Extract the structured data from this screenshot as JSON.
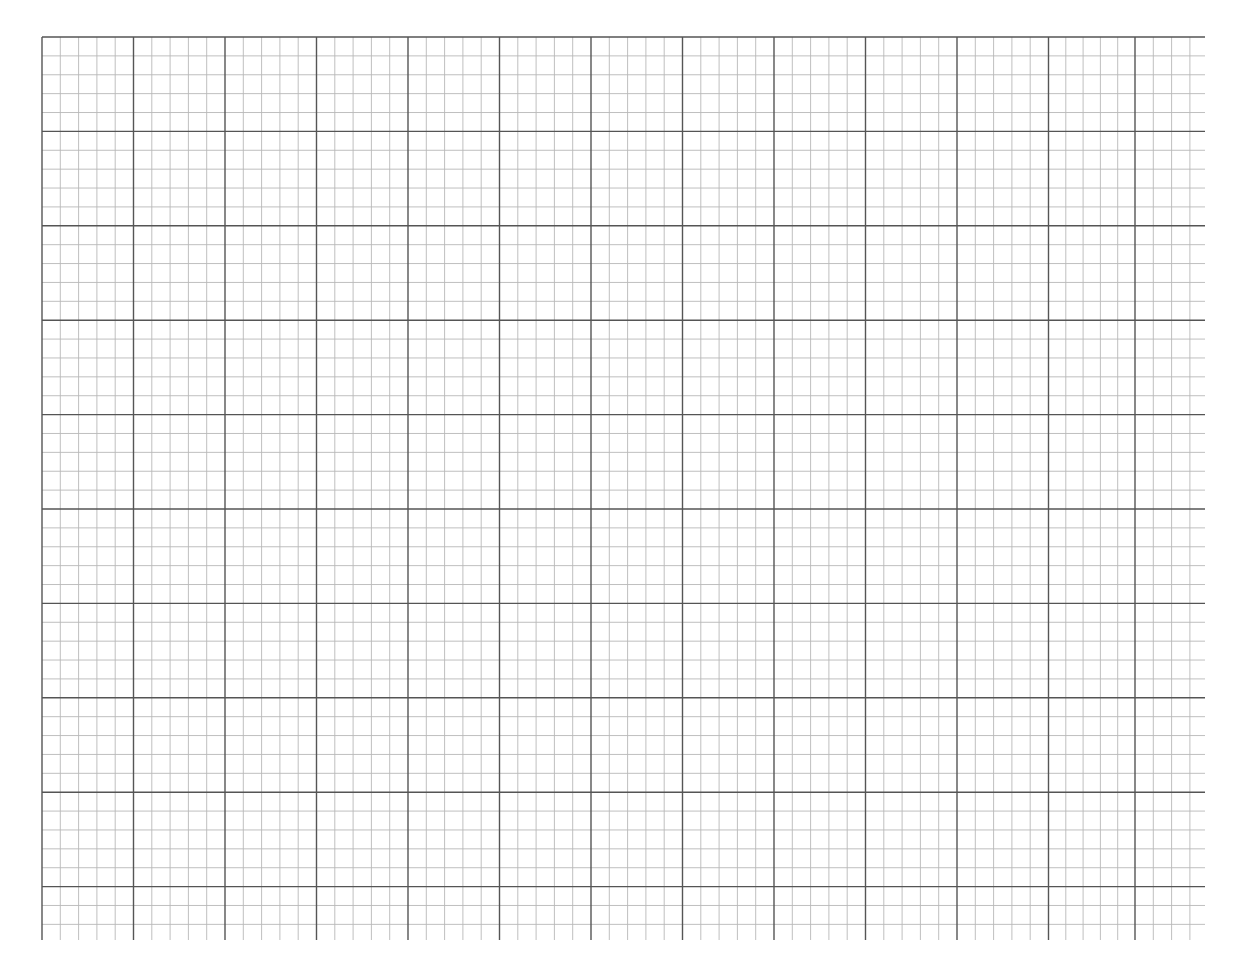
{
  "sheet": {
    "type": "graph-paper",
    "background_color": "#ffffff",
    "grid": {
      "origin_x": 42,
      "origin_y": 37,
      "right_edge_x": 1205,
      "bottom_edge_y": 940,
      "major_vertical_x": [
        42,
        133.5,
        225,
        316.5,
        408,
        499.5,
        591,
        682.5,
        774,
        865.5,
        957,
        1048.5,
        1135
      ],
      "major_horizontal_y": [
        37,
        131.4,
        225.8,
        320.2,
        414.6,
        509,
        603.4,
        697.8,
        792.2,
        886.6
      ],
      "minor_per_major": 5,
      "major_line_color": "#555555",
      "minor_line_color": "#b8b8b8",
      "major_line_width": 1.4,
      "minor_line_width": 0.9
    }
  }
}
